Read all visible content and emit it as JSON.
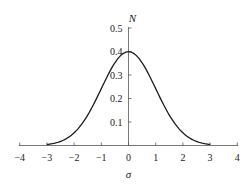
{
  "chart_data": {
    "type": "line",
    "title": "",
    "xlabel": "σ",
    "ylabel": "N",
    "xlim": [
      -4,
      4
    ],
    "ylim": [
      0,
      0.5
    ],
    "x_ticks": [
      "-4",
      "-3",
      "-2",
      "-1",
      "0",
      "1",
      "2",
      "3",
      "4"
    ],
    "y_ticks": [
      "0.1",
      "0.2",
      "0.3",
      "0.4",
      "0.5"
    ],
    "grid": false,
    "legend": null,
    "series": [
      {
        "name": "Standard normal distribution",
        "x": [
          -3,
          -2.5,
          -2,
          -1.5,
          -1,
          -0.5,
          0,
          0.5,
          1,
          1.5,
          2,
          2.5,
          3
        ],
        "y": [
          0.004,
          0.018,
          0.054,
          0.13,
          0.242,
          0.352,
          0.399,
          0.352,
          0.242,
          0.13,
          0.054,
          0.018,
          0.004
        ]
      }
    ],
    "line_color": "#1a1a1a",
    "axis_color": "#555555"
  }
}
